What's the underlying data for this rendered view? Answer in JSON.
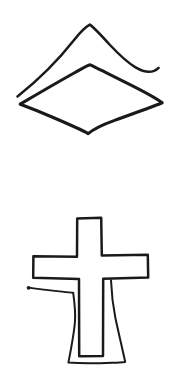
{
  "page": {
    "background_color": "#ffffff",
    "ink_color": "#1a1a1a",
    "width": 193,
    "height": 375
  },
  "drawing": {
    "description": "Two black ink line-drawn figures on a plain white background, stacked vertically with no text, labels, or user-interface controls.",
    "figures": [
      {
        "id": "diamond-with-roof",
        "name": "diamond-and-chevron-figure",
        "position": "upper",
        "description": "A wide flat diamond (rhombus) outline with an open chevron / roof-like angled line arching above it.",
        "parts": [
          {
            "id": "chevron",
            "name": "chevron-roof-line",
            "description": "Open inverted-V line, apex near top center, left leg descending to lower left, right leg descending to middle right.",
            "points": "17,97 90,25 159,67"
          },
          {
            "id": "diamond",
            "name": "diamond-outline",
            "description": "Closed four-sided rhombus, pointed left, right, top and bottom.",
            "points": "20,104 90,65 162,103 88,134"
          }
        ]
      },
      {
        "id": "cross-with-robe",
        "name": "cross-and-robe-figure",
        "position": "lower",
        "description": "An outlined Latin cross whose lower vertical stem is enclosed by a wider flared robe-like shape, with a short horizontal hook protruding from the left side just below the cross arm.",
        "parts": [
          {
            "id": "cross-outline",
            "name": "cross-outline",
            "description": "Outlined Latin cross: narrow vertical bar with a wide horizontal crossbar near the upper third.",
            "points": "77,218 101,218 101,256 148,255 148,278 103,279 103,356 79,356 79,279 33,278 33,256 77,257"
          },
          {
            "id": "robe",
            "name": "robe-skirt-outline",
            "description": "Flared open shape around the lower stem of the cross, narrow at the top and splaying wider toward the bottom, closed by a slightly wavy baseline.",
            "points": "73,293 68,363 125,362 111,280"
          },
          {
            "id": "hook",
            "name": "left-hook-line",
            "description": "Short nearly horizontal stub line extending leftwards from the robe's upper left corner, ending in a small blunt tip.",
            "points": "28,288 73,293"
          }
        ]
      }
    ]
  }
}
